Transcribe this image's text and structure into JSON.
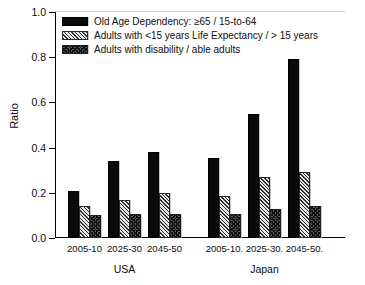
{
  "chart_data": {
    "type": "bar",
    "title": "",
    "xlabel": "",
    "ylabel": "Ratio",
    "ylim": [
      0.0,
      1.0
    ],
    "yticks": [
      "0.0",
      "0.2",
      "0.4",
      "0.6",
      "0.8",
      "1.0"
    ],
    "ytick_values": [
      0.0,
      0.2,
      0.4,
      0.6,
      0.8,
      1.0
    ],
    "grid": false,
    "legend_position": "upper-left-inside",
    "groups": [
      "USA",
      "Japan"
    ],
    "categories": [
      "2005-10",
      "2025-30",
      "2045-50",
      "2005-10",
      "2025-30",
      "2045-50"
    ],
    "group_of_category": [
      "USA",
      "USA",
      "USA",
      "Japan",
      "Japan",
      "Japan"
    ],
    "series": [
      {
        "name": "Old Age Dependency: ≥65 / 15-to-64",
        "pattern": "solid-black",
        "color": "#0a0a0a",
        "values": [
          0.21,
          0.34,
          0.38,
          0.355,
          0.55,
          0.79
        ]
      },
      {
        "name": "Adults with <15 years Life Expectancy / > 15 years",
        "pattern": "diagonal-hatch",
        "color": "#d9d9d9",
        "values": [
          0.14,
          0.17,
          0.2,
          0.185,
          0.27,
          0.29
        ]
      },
      {
        "name": "Adults with disability / able adults",
        "pattern": "checkerboard",
        "color": "#5a5a5a",
        "values": [
          0.1,
          0.105,
          0.105,
          0.105,
          0.13,
          0.14
        ]
      }
    ]
  },
  "legend": {
    "items": [
      {
        "label": "Old Age Dependency: ≥65 / 15-to-64"
      },
      {
        "label": "Adults with <15 years Life Expectancy / > 15 years"
      },
      {
        "label": "Adults with disability / able adults"
      }
    ]
  },
  "axes": {
    "y_title": "Ratio",
    "y_tick_labels": [
      "1.0",
      "0.8",
      "0.6",
      "0.4",
      "0.2",
      "0.0"
    ],
    "x_tick_labels": [
      "2005-10",
      "2025-30",
      "2045-50",
      "2005-10.",
      "2025-30.",
      "2045-50."
    ],
    "group_labels": [
      "USA",
      "Japan"
    ]
  }
}
